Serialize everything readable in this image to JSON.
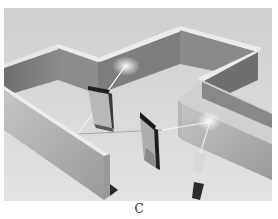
{
  "figure": {
    "panel_label": "C",
    "colors": {
      "floor": "#dcdcdc",
      "wall_top": "#e8e8e8",
      "wall_dark": "#7a7a7a",
      "wall_mid": "#a6a6a6",
      "wall_light": "#bdbdbd",
      "beam": "#f4f4f4",
      "mirror_frame": "#1e1e1e",
      "mirror_glass": "#b0b0b0"
    }
  }
}
